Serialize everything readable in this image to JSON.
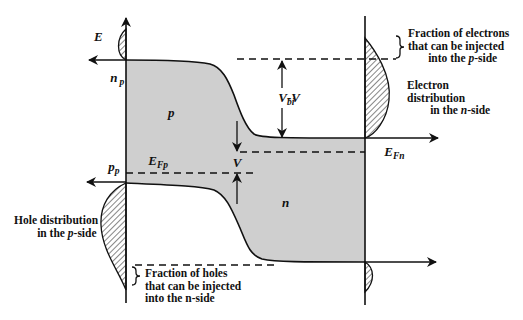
{
  "axes": {
    "energy": "E",
    "electron_density": {
      "main": "n",
      "sub": "p"
    },
    "hole_density": {
      "main": "p",
      "sub": "p"
    }
  },
  "regions": {
    "p_side": "p",
    "n_side": "n"
  },
  "fermi_levels": {
    "p_side": {
      "main": "E",
      "sub": "Fp"
    },
    "n_side": {
      "main": "E",
      "sub": "Fn"
    }
  },
  "potentials": {
    "barrier": {
      "main": "V",
      "sub": "bi",
      "suffix": "-V"
    },
    "applied": "V"
  },
  "annotations": {
    "electron_fraction": {
      "line1": "Fraction of electrons",
      "line2": "that can be injected",
      "line3": {
        "prefix": "into the ",
        "italic": "p",
        "suffix": "-side"
      }
    },
    "electron_distribution": {
      "line1": "Electron",
      "line2": "distribution",
      "line3": {
        "prefix": "in the ",
        "italic": "n",
        "suffix": "-side"
      }
    },
    "hole_distribution": {
      "line1": "Hole distribution",
      "line2": {
        "prefix": "in the ",
        "italic": "p",
        "suffix": "-side"
      }
    },
    "hole_fraction": {
      "line1": "Fraction of holes",
      "line2": "that can be injected",
      "line3": "into the n-side"
    }
  },
  "colors": {
    "background": "#ffffff",
    "band_fill": "#cfcfcf",
    "line": "#111111"
  }
}
